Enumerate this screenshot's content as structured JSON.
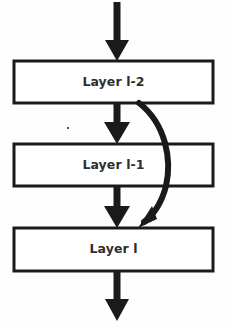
{
  "figure": {
    "type": "flow-diagram",
    "title": "",
    "background_color": "#fefefe",
    "stroke_color": "#1a1a1a",
    "text_color": "#2e2e2e",
    "box_fill": "#ffffff"
  },
  "nodes": [
    {
      "id": "layer-l-2",
      "label": "Layer l-2",
      "shape": "rectangle",
      "x": 14,
      "y": 61,
      "width": 199,
      "height": 42
    },
    {
      "id": "layer-l-1",
      "label": "Layer l-1",
      "shape": "rectangle",
      "x": 14,
      "y": 144,
      "width": 199,
      "height": 42
    },
    {
      "id": "layer-l",
      "label": "Layer l",
      "shape": "rectangle",
      "x": 14,
      "y": 228,
      "width": 199,
      "height": 43
    }
  ],
  "edges": [
    {
      "id": "input-arrow",
      "kind": "straight",
      "from": "input",
      "to": "layer-l-2",
      "label": ""
    },
    {
      "id": "edge-l2-to-l1",
      "kind": "straight",
      "from": "layer-l-2",
      "to": "layer-l-1",
      "label": ""
    },
    {
      "id": "edge-l1-to-l",
      "kind": "straight",
      "from": "layer-l-1",
      "to": "layer-l",
      "label": ""
    },
    {
      "id": "skip-connection",
      "kind": "curved",
      "from": "layer-l-2",
      "to": "layer-l",
      "label": ""
    },
    {
      "id": "output-arrow",
      "kind": "straight",
      "from": "layer-l",
      "to": "output",
      "label": ""
    }
  ],
  "artifacts": [
    {
      "id": "scan-speck",
      "x": 68,
      "y": 128,
      "size": 2
    }
  ]
}
